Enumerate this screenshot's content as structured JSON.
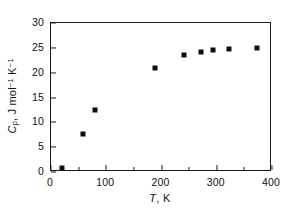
{
  "chart_data": {
    "type": "scatter",
    "title": "",
    "xlabel": "T, K",
    "ylabel": "Cp, J mol-1 K-1",
    "xlabel_parts": {
      "symbol": "T",
      "unit": "K",
      "separator": ", "
    },
    "ylabel_parts": {
      "symbol": "C",
      "subscript": "p",
      "separator": ", ",
      "unit_main": "J mol",
      "exp1": "−1",
      "unit_second": " K",
      "exp2": "−1"
    },
    "xlim": [
      0,
      400
    ],
    "ylim": [
      0,
      30
    ],
    "xticks": [
      0,
      100,
      200,
      300,
      400
    ],
    "xtick_labels": [
      "0",
      "100",
      "200",
      "300",
      "400"
    ],
    "xticks_minor": [
      50,
      150,
      250,
      350
    ],
    "yticks": [
      0,
      5,
      10,
      15,
      20,
      25,
      30
    ],
    "ytick_labels": [
      "0",
      "5",
      "10",
      "15",
      "20",
      "25",
      "30"
    ],
    "grid": false,
    "legend": null,
    "marker": "square",
    "marker_color": "#0d0d0d",
    "x": [
      20,
      58,
      80,
      189,
      241,
      272,
      294,
      322,
      373
    ],
    "y": [
      0.8,
      7.7,
      12.4,
      20.9,
      23.6,
      24.2,
      24.5,
      24.8,
      24.9
    ],
    "points": [
      {
        "T": 20,
        "Cp": 0.8
      },
      {
        "T": 58,
        "Cp": 7.7
      },
      {
        "T": 80,
        "Cp": 12.4
      },
      {
        "T": 189,
        "Cp": 20.9
      },
      {
        "T": 241,
        "Cp": 23.6
      },
      {
        "T": 272,
        "Cp": 24.2
      },
      {
        "T": 294,
        "Cp": 24.5
      },
      {
        "T": 322,
        "Cp": 24.8
      },
      {
        "T": 373,
        "Cp": 24.9
      }
    ]
  },
  "colors": {
    "axis": "#1a1a1a",
    "marker": "#0d0d0d",
    "background": "#ffffff",
    "text": "#111111"
  }
}
